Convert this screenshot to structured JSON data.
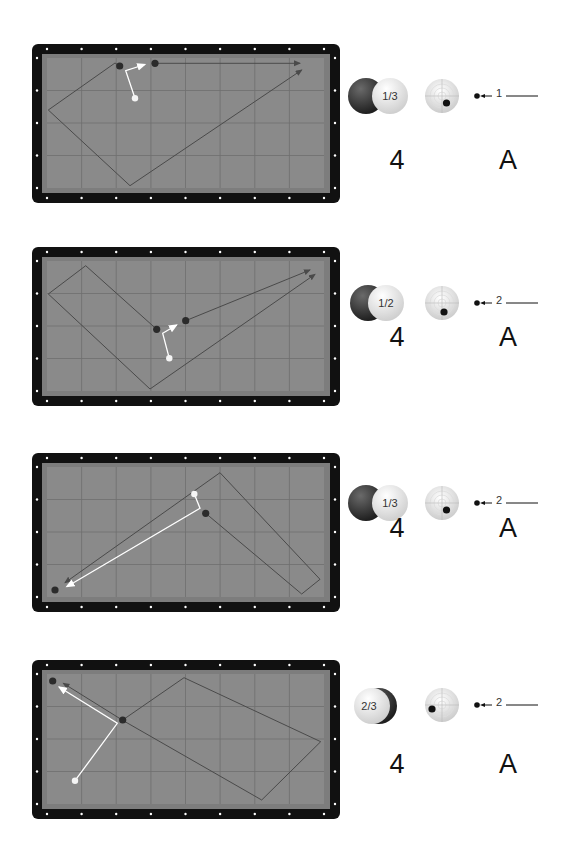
{
  "colors": {
    "frame": "#111111",
    "cushion": "#7d7d7d",
    "felt": "#8a8a8a",
    "grid": "#6e6e6e",
    "track": "#4a4a4a",
    "cue_track": "#ffffff",
    "diamond": "#ffffff"
  },
  "diagrams": [
    {
      "index": 1,
      "ball_contact": "1/3",
      "contact_side": "right",
      "tip_position": {
        "x": 0.62,
        "y": 0.72
      },
      "speed": "1",
      "stroke_number": "4",
      "stroke_letter": "A"
    },
    {
      "index": 2,
      "ball_contact": "1/2",
      "contact_side": "right",
      "tip_position": {
        "x": 0.55,
        "y": 0.78
      },
      "speed": "2",
      "stroke_number": "4",
      "stroke_letter": "A"
    },
    {
      "index": 3,
      "ball_contact": "1/3",
      "contact_side": "right",
      "tip_position": {
        "x": 0.62,
        "y": 0.72
      },
      "speed": "2",
      "stroke_number": "4",
      "stroke_letter": "A"
    },
    {
      "index": 4,
      "ball_contact": "2/3",
      "contact_side": "left",
      "tip_position": {
        "x": 0.22,
        "y": 0.6
      },
      "speed": "2",
      "stroke_number": "4",
      "stroke_letter": "A"
    }
  ]
}
